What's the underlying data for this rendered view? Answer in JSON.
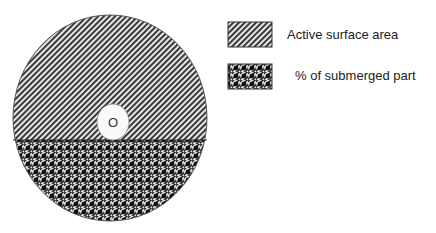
{
  "diagram": {
    "center_label": "O",
    "regions": [
      {
        "name": "upper",
        "pattern": "diagonal-hatch"
      },
      {
        "name": "lower",
        "pattern": "dotted-hatch"
      }
    ]
  },
  "legend": {
    "items": [
      {
        "label": "Active surface area",
        "pattern": "diagonal-hatch"
      },
      {
        "label": "% of submerged part",
        "pattern": "dotted-hatch"
      }
    ]
  },
  "colors": {
    "hatch_dark": "#3a3a3a",
    "hatch_light": "#e8e8e8",
    "dot": "#111111",
    "background": "#ffffff"
  }
}
